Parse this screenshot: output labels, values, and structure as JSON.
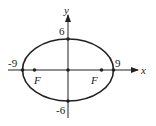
{
  "diagram": {
    "type": "ellipse",
    "equation_params": {
      "a": 9,
      "b": 6
    },
    "axes": {
      "x_label": "x",
      "y_label": "y"
    },
    "intercepts": {
      "x_neg": "-9",
      "x_pos": "9",
      "y_pos": "6",
      "y_neg": "-6"
    },
    "foci": [
      {
        "label": "F",
        "side": "left"
      },
      {
        "label": "F",
        "side": "right"
      }
    ],
    "colors": {
      "stroke": "#222222",
      "background": "#ffffff"
    }
  }
}
